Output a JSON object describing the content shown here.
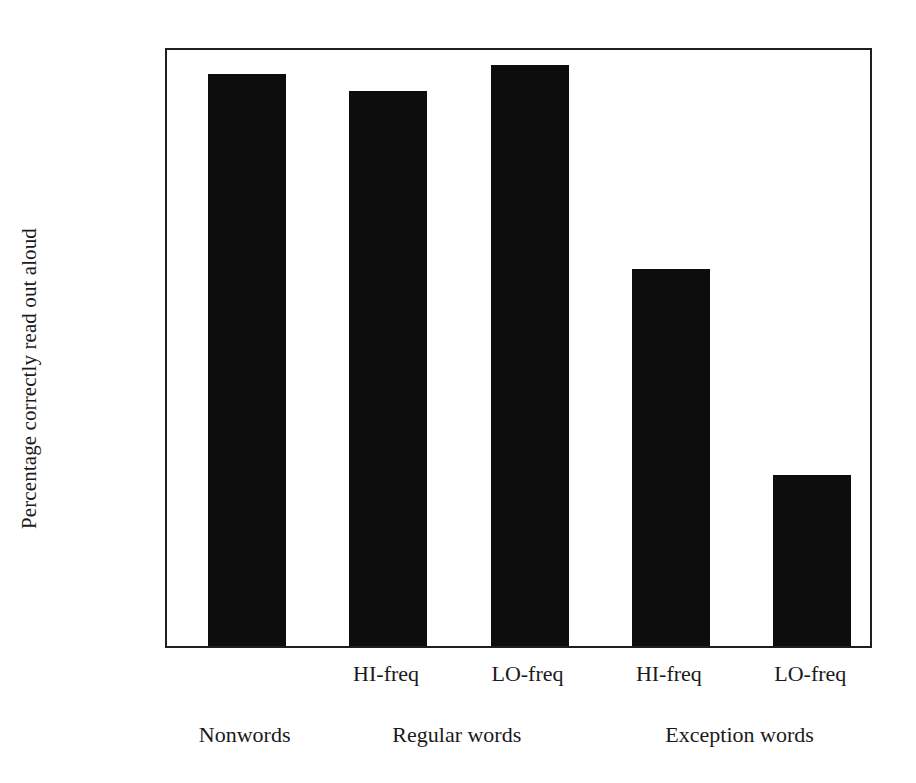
{
  "chart_data": {
    "type": "bar",
    "title": "",
    "xlabel": "",
    "ylabel": "Percentage correctly read out aloud",
    "ylim": [
      0,
      1
    ],
    "grid": false,
    "legend": "none",
    "categories": [
      "Nonwords",
      "HI-freq",
      "LO-freq",
      "HI-freq",
      "LO-freq"
    ],
    "values": [
      0.953,
      0.925,
      0.968,
      0.628,
      0.285
    ],
    "bars": [
      {
        "label": "",
        "group": "Nonwords",
        "value": 0.953
      },
      {
        "label": "HI-freq",
        "group": "Regular words",
        "value": 0.925
      },
      {
        "label": "LO-freq",
        "group": "Regular words",
        "value": 0.968
      },
      {
        "label": "HI-freq",
        "group": "Exception words",
        "value": 0.628
      },
      {
        "label": "LO-freq",
        "group": "Exception words",
        "value": 0.285
      }
    ],
    "groups": [
      {
        "label": "Nonwords",
        "center": 0
      },
      {
        "label": "Regular words",
        "center": 1.5
      },
      {
        "label": "Exception words",
        "center": 3.5
      }
    ],
    "yticks": [
      "0",
      "0.1",
      "0.2",
      "0.3",
      "0.4",
      "0.5",
      "0.6",
      "0.7",
      "0.8",
      "0.9",
      "1"
    ],
    "ytick_values": [
      0,
      0.1,
      0.2,
      0.3,
      0.4,
      0.5,
      0.6,
      0.7,
      0.8,
      0.9,
      1.0
    ],
    "bar_color": "#0d0d0d",
    "axis_color": "#1f1f1f",
    "background_color": "#ffffff"
  }
}
